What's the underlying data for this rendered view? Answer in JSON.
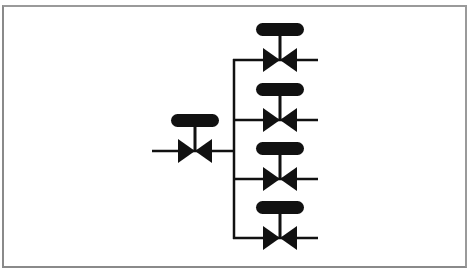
{
  "diagram": {
    "type": "valve-manifold-schematic",
    "colors": {
      "line": "#111111",
      "frame": "#8a8a8a",
      "background": "#ffffff"
    },
    "inlet_valve": {
      "label": "inlet-valve",
      "cx": 195,
      "cy": 151
    },
    "header": {
      "x": 234,
      "y_top": 60,
      "y_bottom": 238
    },
    "branch_valves": [
      {
        "label": "branch-valve-1",
        "cx": 280,
        "cy": 60
      },
      {
        "label": "branch-valve-2",
        "cx": 280,
        "cy": 120
      },
      {
        "label": "branch-valve-3",
        "cx": 280,
        "cy": 179
      },
      {
        "label": "branch-valve-4",
        "cx": 280,
        "cy": 238
      }
    ]
  }
}
